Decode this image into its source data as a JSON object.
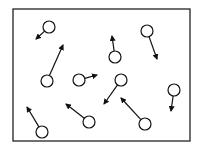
{
  "diagram": {
    "container": {
      "x": 13,
      "y": 9,
      "width": 177,
      "height": 132,
      "stroke": "#222222"
    },
    "molecule_radius": 6,
    "molecules": [
      {
        "cx": 49,
        "cy": 27,
        "ax": 36,
        "ay": 39
      },
      {
        "cx": 47,
        "cy": 81,
        "ax": 63,
        "ay": 45
      },
      {
        "cx": 115,
        "cy": 57,
        "ax": 112,
        "ay": 36
      },
      {
        "cx": 147,
        "cy": 31,
        "ax": 157,
        "ay": 59
      },
      {
        "cx": 79,
        "cy": 80,
        "ax": 97,
        "ay": 75
      },
      {
        "cx": 121,
        "cy": 80,
        "ax": 104,
        "ay": 104
      },
      {
        "cx": 174,
        "cy": 90,
        "ax": 171,
        "ay": 111
      },
      {
        "cx": 42,
        "cy": 132,
        "ax": 27,
        "ay": 107
      },
      {
        "cx": 89,
        "cy": 122,
        "ax": 66,
        "ay": 104
      },
      {
        "cx": 145,
        "cy": 124,
        "ax": 121,
        "ay": 98
      }
    ]
  }
}
